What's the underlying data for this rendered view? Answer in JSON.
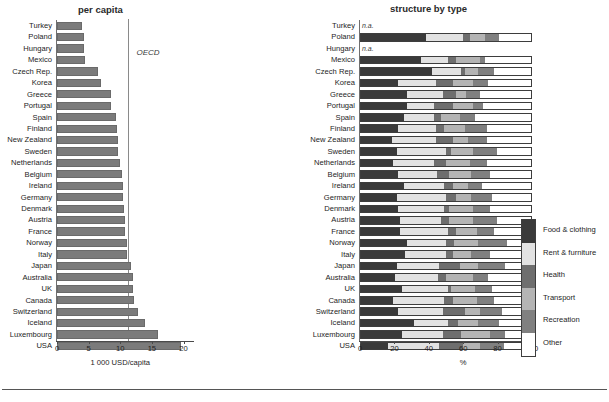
{
  "left_panel": {
    "title": "per capita",
    "reference_label": "OECD"
  },
  "right_panel": {
    "title": "structure by type"
  },
  "legend": {
    "items": [
      {
        "label": "Food & clothing",
        "color": "#3a3a3a"
      },
      {
        "label": "Rent & furniture",
        "color": "#e2e2e2"
      },
      {
        "label": "Health",
        "color": "#6e6e6e"
      },
      {
        "label": "Transport",
        "color": "#b4b4b4"
      },
      {
        "label": "Recreation",
        "color": "#808080"
      },
      {
        "label": "Other",
        "color": "#ffffff"
      }
    ]
  },
  "chart_data": [
    {
      "type": "bar",
      "title": "per capita",
      "orientation": "horizontal",
      "xlabel": "1 000 USD/capita",
      "ylabel": "",
      "xlim": [
        0,
        21.5
      ],
      "xticks": [
        0,
        5,
        10,
        15,
        20
      ],
      "grid": false,
      "bar_color": "#7b7b7b",
      "reference_line": {
        "label": "OECD",
        "value": 11.3
      },
      "categories": [
        "Turkey",
        "Poland",
        "Hungary",
        "Mexico",
        "Czech Rep.",
        "Korea",
        "Greece",
        "Portugal",
        "Spain",
        "Finland",
        "New Zealand",
        "Sweden",
        "Netherlands",
        "Belgium",
        "Ireland",
        "Germany",
        "Denmark",
        "Austria",
        "France",
        "Norway",
        "Italy",
        "Japan",
        "Australia",
        "UK",
        "Canada",
        "Switzerland",
        "Iceland",
        "Luxembourg",
        "USA"
      ],
      "values": [
        3.9,
        4.3,
        4.3,
        4.4,
        6.5,
        7.0,
        8.5,
        8.6,
        9.3,
        9.5,
        9.7,
        9.6,
        10.0,
        10.3,
        10.4,
        10.4,
        10.6,
        10.7,
        10.7,
        11.0,
        11.0,
        11.7,
        12.0,
        12.0,
        12.1,
        12.8,
        13.9,
        15.9,
        19.6
      ]
    },
    {
      "type": "bar",
      "subtype": "stacked-percent",
      "title": "structure by type",
      "orientation": "horizontal",
      "xlabel": "%",
      "ylabel": "",
      "xlim": [
        0,
        100
      ],
      "xticks": [
        0,
        20,
        40,
        60,
        80,
        100
      ],
      "grid": false,
      "legend_position": "right",
      "series": [
        {
          "name": "Food & clothing",
          "color": "#3a3a3a"
        },
        {
          "name": "Rent & furniture",
          "color": "#e2e2e2"
        },
        {
          "name": "Health",
          "color": "#6e6e6e"
        },
        {
          "name": "Transport",
          "color": "#b4b4b4"
        },
        {
          "name": "Recreation",
          "color": "#808080"
        },
        {
          "name": "Other",
          "color": "#ffffff"
        }
      ],
      "categories": [
        "Turkey",
        "Poland",
        "Hungary",
        "Mexico",
        "Czech Rep.",
        "Korea",
        "Greece",
        "Portugal",
        "Spain",
        "Finland",
        "New Zealand",
        "Sweden",
        "Netherlands",
        "Belgium",
        "Ireland",
        "Germany",
        "Denmark",
        "Austria",
        "France",
        "Norway",
        "Italy",
        "Japan",
        "Australia",
        "UK",
        "Canada",
        "Switzerland",
        "Iceland",
        "Luxembourg",
        "USA"
      ],
      "na_label": "n.a.",
      "rows": [
        {
          "category": "Turkey",
          "na": true,
          "values": []
        },
        {
          "category": "Poland",
          "na": false,
          "values": [
            38,
            22,
            4,
            9,
            8,
            19
          ]
        },
        {
          "category": "Hungary",
          "na": true,
          "values": []
        },
        {
          "category": "Mexico",
          "na": false,
          "values": [
            35,
            16,
            5,
            14,
            3,
            27
          ]
        },
        {
          "category": "Czech Rep.",
          "na": false,
          "values": [
            42,
            17,
            2,
            8,
            9,
            22
          ]
        },
        {
          "category": "Korea",
          "na": false,
          "values": [
            22,
            22,
            10,
            12,
            9,
            25
          ]
        },
        {
          "category": "Greece",
          "na": false,
          "values": [
            27,
            21,
            8,
            6,
            8,
            30
          ]
        },
        {
          "category": "Portugal",
          "na": false,
          "values": [
            27,
            16,
            11,
            12,
            6,
            28
          ]
        },
        {
          "category": "Spain",
          "na": false,
          "values": [
            25,
            18,
            4,
            11,
            9,
            33
          ]
        },
        {
          "category": "Finland",
          "na": false,
          "values": [
            22,
            22,
            5,
            12,
            13,
            26
          ]
        },
        {
          "category": "New Zealand",
          "na": false,
          "values": [
            18,
            26,
            10,
            9,
            11,
            26
          ]
        },
        {
          "category": "Sweden",
          "na": false,
          "values": [
            21,
            29,
            3,
            13,
            14,
            20
          ]
        },
        {
          "category": "Netherlands",
          "na": false,
          "values": [
            19,
            24,
            7,
            14,
            10,
            26
          ]
        },
        {
          "category": "Belgium",
          "na": false,
          "values": [
            22,
            23,
            7,
            13,
            11,
            24
          ]
        },
        {
          "category": "Ireland",
          "na": false,
          "values": [
            25,
            24,
            5,
            9,
            8,
            29
          ]
        },
        {
          "category": "Germany",
          "na": false,
          "values": [
            21,
            29,
            6,
            9,
            12,
            23
          ]
        },
        {
          "category": "Denmark",
          "na": false,
          "values": [
            22,
            27,
            3,
            14,
            10,
            24
          ]
        },
        {
          "category": "Austria",
          "na": false,
          "values": [
            23,
            24,
            5,
            14,
            14,
            20
          ]
        },
        {
          "category": "France",
          "na": false,
          "values": [
            23,
            28,
            5,
            12,
            10,
            22
          ]
        },
        {
          "category": "Norway",
          "na": false,
          "values": [
            27,
            23,
            5,
            14,
            17,
            14
          ]
        },
        {
          "category": "Italy",
          "na": false,
          "values": [
            26,
            24,
            4,
            11,
            11,
            24
          ]
        },
        {
          "category": "Japan",
          "na": false,
          "values": [
            21,
            25,
            12,
            11,
            16,
            15
          ]
        },
        {
          "category": "Australia",
          "na": false,
          "values": [
            20,
            25,
            5,
            16,
            9,
            25
          ]
        },
        {
          "category": "UK",
          "na": false,
          "values": [
            24,
            27,
            2,
            14,
            10,
            23
          ]
        },
        {
          "category": "Canada",
          "na": false,
          "values": [
            19,
            30,
            5,
            14,
            10,
            22
          ]
        },
        {
          "category": "Switzerland",
          "na": false,
          "values": [
            22,
            26,
            13,
            9,
            13,
            17
          ]
        },
        {
          "category": "Iceland",
          "na": false,
          "values": [
            31,
            20,
            6,
            12,
            12,
            19
          ]
        },
        {
          "category": "Luxembourg",
          "na": false,
          "values": [
            24,
            24,
            11,
            17,
            9,
            15
          ]
        },
        {
          "category": "USA",
          "na": false,
          "values": [
            16,
            30,
            14,
            10,
            14,
            16
          ]
        }
      ]
    }
  ]
}
